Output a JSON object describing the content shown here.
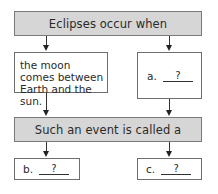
{
  "diagram": {
    "top_box": {
      "text": "Eclipses occur when"
    },
    "left_box": {
      "text": "the moon comes between Earth and the sun."
    },
    "right_box": {
      "label": "a.",
      "blank": "?"
    },
    "middle_box": {
      "text": "Such an event is called a"
    },
    "bottom_left_box": {
      "label": "b.",
      "blank": "?"
    },
    "bottom_right_box": {
      "label": "c.",
      "blank": "?"
    }
  },
  "colors": {
    "header_fill": "#d6d6d6",
    "border": "#6e6e6e",
    "text": "#2a2a2a"
  }
}
